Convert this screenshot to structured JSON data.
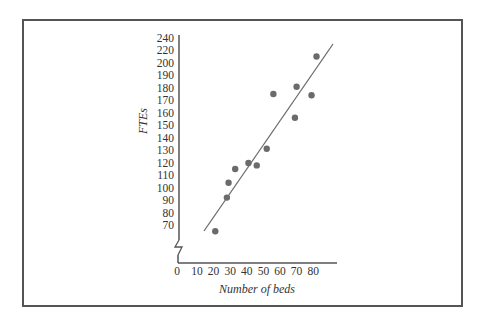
{
  "chart_data": {
    "type": "scatter",
    "title": "",
    "xlabel": "Number of beds",
    "ylabel": "FTEs",
    "x_ticks": [
      0,
      10,
      20,
      30,
      40,
      50,
      60,
      70,
      80
    ],
    "y_ticks": [
      70,
      80,
      90,
      100,
      110,
      120,
      130,
      140,
      150,
      160,
      170,
      180,
      190,
      200,
      220,
      240
    ],
    "y_axis_break": true,
    "xlim": [
      0,
      90
    ],
    "ylim": [
      60,
      240
    ],
    "grid": false,
    "legend": null,
    "series": [
      {
        "name": "Hospitals",
        "type": "scatter",
        "color": "#6b6b6b",
        "points": [
          {
            "x": 21,
            "y": 65
          },
          {
            "x": 28,
            "y": 92
          },
          {
            "x": 29,
            "y": 104
          },
          {
            "x": 33,
            "y": 115
          },
          {
            "x": 41,
            "y": 120
          },
          {
            "x": 46,
            "y": 118
          },
          {
            "x": 52,
            "y": 131
          },
          {
            "x": 56,
            "y": 175
          },
          {
            "x": 69,
            "y": 156
          },
          {
            "x": 70,
            "y": 181
          },
          {
            "x": 79,
            "y": 174
          },
          {
            "x": 82,
            "y": 210
          }
        ]
      },
      {
        "name": "Regression line",
        "type": "line",
        "color": "#6b6b6b",
        "points": [
          {
            "x": 15,
            "y": 70
          },
          {
            "x": 91,
            "y": 230
          }
        ]
      }
    ]
  }
}
